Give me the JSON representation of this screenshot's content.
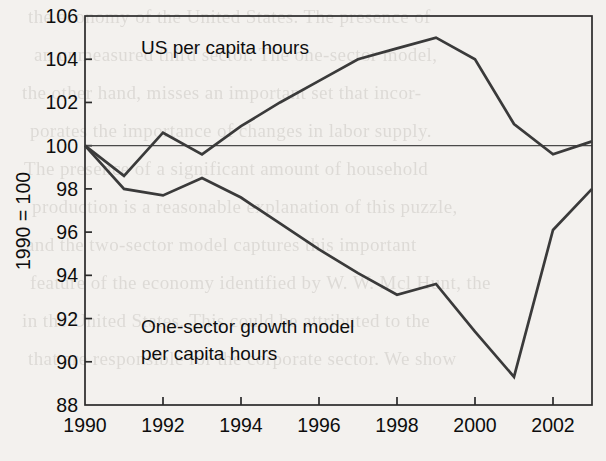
{
  "chart_data": {
    "type": "line",
    "title": "",
    "xlabel": "",
    "ylabel": "1990 = 100",
    "xlim": [
      1990,
      2003
    ],
    "ylim": [
      88,
      106
    ],
    "grid": false,
    "legend_position": "inline-annotations",
    "reference_line": 100,
    "x": [
      1990,
      1991,
      1992,
      1993,
      1994,
      1995,
      1996,
      1997,
      1998,
      1999,
      2000,
      2001,
      2002,
      2003
    ],
    "xticks": [
      1990,
      1992,
      1994,
      1996,
      1998,
      2000,
      2002
    ],
    "xtick_labels": [
      "1990",
      "1992",
      "1994",
      "1996",
      "1998",
      "2000",
      "2002"
    ],
    "yticks": [
      88,
      90,
      92,
      94,
      96,
      98,
      100,
      102,
      104,
      106
    ],
    "ytick_labels": [
      "88",
      "90",
      "92",
      "94",
      "96",
      "98",
      "100",
      "102",
      "104",
      "106"
    ],
    "series": [
      {
        "name": "US per capita hours",
        "annotation": "US per capita hours",
        "color": "#3a3a3a",
        "values": [
          100.0,
          98.6,
          100.6,
          99.6,
          100.9,
          102.0,
          103.0,
          104.0,
          104.5,
          105.0,
          104.0,
          101.0,
          99.6,
          100.2
        ]
      },
      {
        "name": "One-sector growth model per capita hours",
        "annotation": "One-sector growth model\nper capita hours",
        "annotation_line1": "One-sector growth model",
        "annotation_line2": "per capita hours",
        "color": "#3a3a3a",
        "values": [
          100.0,
          98.0,
          97.7,
          98.5,
          97.6,
          96.4,
          95.2,
          94.1,
          93.1,
          93.6,
          91.4,
          89.3,
          96.1,
          98.0
        ]
      }
    ]
  },
  "annotations": {
    "us_label": "US per capita hours",
    "model_label_line1": "One-sector growth model",
    "model_label_line2": "per capita hours"
  },
  "axes": {
    "y_axis_title": "1990 = 100"
  },
  "background_text": {
    "lines": [
      "the economy of the United States. The presence of",
      "an unmeasured third sector. The one-sector model,",
      "the other hand, misses an important set that incor-",
      "porates the importance of changes in labor supply.",
      "The presence of a significant amount of household",
      "production is a reasonable explanation of this puzzle,",
      "and the two-sector model captures this important",
      "feature of the economy identified by W. W. Mcl Hunt, the",
      "in the United States. This could be attributed to the",
      "that are responsible for the corporate sector. We show"
    ]
  }
}
